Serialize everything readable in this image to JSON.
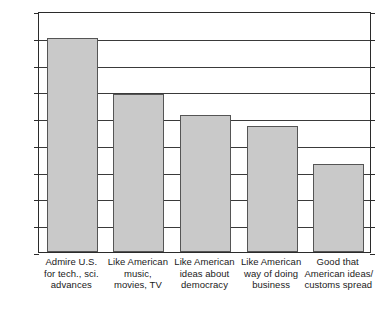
{
  "chart_data": {
    "type": "bar",
    "title": "",
    "subtitle": "",
    "xlabel": "",
    "ylabel": "",
    "ylim": [
      0,
      90
    ],
    "ytick_step": 10,
    "yticks": [
      0,
      10,
      20,
      30,
      40,
      50,
      60,
      70,
      80,
      90
    ],
    "ytick_labels": [
      "0",
      "10",
      "20",
      "30",
      "40",
      "50",
      "60",
      "70",
      "80",
      "90"
    ],
    "grid": true,
    "grid_axis": "y",
    "legend": false,
    "legend_position": "none",
    "categories": [
      "Admire U.S. for tech., sci. advances",
      "Like American music, movies, TV",
      "Like American ideas about democracy",
      "Like American way of doing business",
      "Good that American ideas/ customs spread"
    ],
    "category_label_lines": [
      [
        "Admire U.S.",
        "for tech., sci.",
        "advances"
      ],
      [
        "Like American",
        "music,",
        "movies, TV"
      ],
      [
        "Like American",
        "ideas about",
        "democracy"
      ],
      [
        "Like American",
        "way of doing",
        "business"
      ],
      [
        "Good that",
        "American ideas/",
        "customs spread"
      ]
    ],
    "values": [
      80,
      59,
      51,
      47,
      33
    ],
    "series": [
      {
        "name": "",
        "values": [
          80,
          59,
          51,
          47,
          33
        ]
      }
    ],
    "colors": {
      "bar_fill": "#c9c9c9",
      "bar_border": "#555555",
      "axis": "#2b2b2b",
      "gridline": "#3a3a3a",
      "text": "#1a1a1a",
      "background": "#ffffff"
    }
  }
}
